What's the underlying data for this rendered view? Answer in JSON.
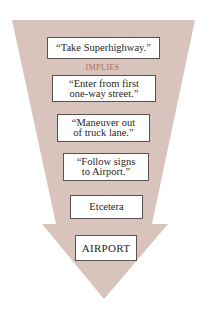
{
  "diagram": {
    "colors": {
      "funnel": "#d9c4bd",
      "box_fill": "#ffffff",
      "box_border": "#5a5250",
      "text": "#2b2626",
      "connector_text": "#b06a58"
    },
    "connector_label": "IMPLIES",
    "steps": [
      {
        "lines": [
          "“Take Superhighway.”"
        ]
      },
      {
        "lines": [
          "“Enter from first",
          "one-way street.”"
        ]
      },
      {
        "lines": [
          "“Maneuver out",
          "of truck lane.”"
        ]
      },
      {
        "lines": [
          "“Follow signs",
          "to Airport.”"
        ]
      },
      {
        "lines": [
          "Etcetera"
        ]
      }
    ],
    "goal": "AIRPORT"
  }
}
